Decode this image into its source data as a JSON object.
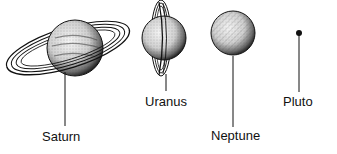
{
  "diagram": {
    "type": "planet-illustrations",
    "planets": [
      {
        "name": "Saturn",
        "has_rings": true,
        "ring_orientation": "tilted-horizontal"
      },
      {
        "name": "Uranus",
        "has_rings": true,
        "ring_orientation": "vertical"
      },
      {
        "name": "Neptune",
        "has_rings": false
      },
      {
        "name": "Pluto",
        "has_rings": false,
        "rendered_as": "small-dot"
      }
    ]
  },
  "labels": {
    "saturn": "Saturn",
    "uranus": "Uranus",
    "neptune": "Neptune",
    "pluto": "Pluto"
  }
}
